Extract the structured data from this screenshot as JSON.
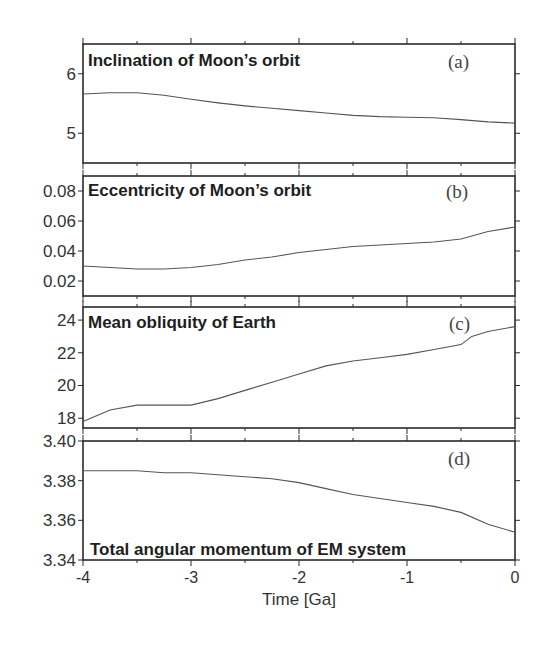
{
  "chart_data": [
    {
      "id": "a",
      "type": "line",
      "title": "Inclination of Moon’s orbit",
      "tag": "(a)",
      "title_position": "top",
      "x": [
        -4.0,
        -3.75,
        -3.5,
        -3.25,
        -3.0,
        -2.75,
        -2.5,
        -2.25,
        -2.0,
        -1.75,
        -1.5,
        -1.25,
        -1.0,
        -0.75,
        -0.5,
        -0.25,
        0.0
      ],
      "values": [
        5.66,
        5.68,
        5.68,
        5.64,
        5.57,
        5.51,
        5.46,
        5.42,
        5.38,
        5.34,
        5.3,
        5.28,
        5.27,
        5.26,
        5.23,
        5.19,
        5.17
      ],
      "ylim": [
        4.5,
        6.5
      ],
      "yticks": [
        5,
        6
      ],
      "ytick_labels": [
        "5",
        "6"
      ],
      "xlim": [
        -4,
        0
      ]
    },
    {
      "id": "b",
      "type": "line",
      "title": "Eccentricity of Moon’s orbit",
      "tag": "(b)",
      "title_position": "top",
      "x": [
        -4.0,
        -3.75,
        -3.5,
        -3.25,
        -3.0,
        -2.75,
        -2.5,
        -2.25,
        -2.0,
        -1.75,
        -1.5,
        -1.25,
        -1.0,
        -0.75,
        -0.5,
        -0.25,
        0.0
      ],
      "values": [
        0.03,
        0.029,
        0.028,
        0.028,
        0.029,
        0.031,
        0.034,
        0.036,
        0.039,
        0.041,
        0.043,
        0.044,
        0.045,
        0.046,
        0.048,
        0.053,
        0.056
      ],
      "ylim": [
        0.01,
        0.09
      ],
      "yticks": [
        0.02,
        0.04,
        0.06,
        0.08
      ],
      "ytick_labels": [
        "0.02",
        "0.04",
        "0.06",
        "0.08"
      ],
      "xlim": [
        -4,
        0
      ]
    },
    {
      "id": "c",
      "type": "line",
      "title": "Mean obliquity of Earth",
      "tag": "(c)",
      "title_position": "top",
      "x": [
        -4.0,
        -3.75,
        -3.5,
        -3.25,
        -3.0,
        -2.75,
        -2.5,
        -2.25,
        -2.0,
        -1.75,
        -1.5,
        -1.25,
        -1.0,
        -0.75,
        -0.5,
        -0.4,
        -0.25,
        0.0
      ],
      "values": [
        17.8,
        18.5,
        18.8,
        18.8,
        18.8,
        19.2,
        19.7,
        20.2,
        20.7,
        21.2,
        21.5,
        21.7,
        21.9,
        22.2,
        22.5,
        23.0,
        23.3,
        23.6
      ],
      "ylim": [
        17.4,
        24.8
      ],
      "yticks": [
        18,
        20,
        22,
        24
      ],
      "ytick_labels": [
        "18",
        "20",
        "22",
        "24"
      ],
      "xlim": [
        -4,
        0
      ]
    },
    {
      "id": "d",
      "type": "line",
      "title": "Total angular momentum of EM system",
      "tag": "(d)",
      "title_position": "bottom",
      "x": [
        -4.0,
        -3.75,
        -3.5,
        -3.25,
        -3.0,
        -2.75,
        -2.5,
        -2.25,
        -2.0,
        -1.75,
        -1.5,
        -1.25,
        -1.0,
        -0.75,
        -0.5,
        -0.25,
        0.0
      ],
      "values": [
        3.385,
        3.385,
        3.385,
        3.384,
        3.384,
        3.383,
        3.382,
        3.381,
        3.379,
        3.376,
        3.373,
        3.371,
        3.369,
        3.367,
        3.364,
        3.358,
        3.354
      ],
      "ylim": [
        3.34,
        3.4
      ],
      "yticks": [
        3.34,
        3.36,
        3.38,
        3.4
      ],
      "ytick_labels": [
        "3.34",
        "3.36",
        "3.38",
        "3.40"
      ],
      "xlim": [
        -4,
        0
      ]
    }
  ],
  "xaxis": {
    "label": "Time [Ga]",
    "ticks": [
      -4,
      -3,
      -2,
      -1,
      0
    ],
    "tick_labels": [
      "-4",
      "-3",
      "-2",
      "-1",
      "0"
    ],
    "minor_ticks": [
      -3.5,
      -2.5,
      -1.5,
      -0.5
    ]
  }
}
